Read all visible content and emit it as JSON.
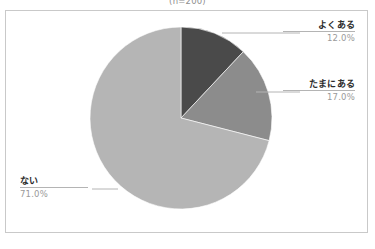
{
  "caption": {
    "sample_size_note": "(n=200)"
  },
  "chart_data": {
    "type": "pie",
    "title": "",
    "subtitle": "(n=200)",
    "xlabel": "",
    "ylabel": "",
    "legend_position": "callout-labels",
    "grid": false,
    "start_angle_deg": 0,
    "direction": "clockwise",
    "categories": [
      "よくある",
      "たまにある",
      "ない"
    ],
    "values": [
      12.0,
      17.0,
      71.0
    ],
    "value_labels": [
      "12.0%",
      "17.0%",
      "71.0%"
    ],
    "unit": "%",
    "colors": [
      "#4a4a4a",
      "#8c8c8c",
      "#b5b5b5"
    ],
    "slices": [
      {
        "label": "よくある",
        "value": 12.0,
        "value_label": "12.0%",
        "color": "#4a4a4a",
        "start_deg": 0.0,
        "end_deg": 43.2
      },
      {
        "label": "たまにある",
        "value": 17.0,
        "value_label": "17.0%",
        "color": "#8c8c8c",
        "start_deg": 43.2,
        "end_deg": 104.4
      },
      {
        "label": "ない",
        "value": 71.0,
        "value_label": "71.0%",
        "color": "#b5b5b5",
        "start_deg": 104.4,
        "end_deg": 360.0
      }
    ]
  },
  "callouts": [
    {
      "label": "よくある",
      "value_label": "12.0%"
    },
    {
      "label": "たまにある",
      "value_label": "17.0%"
    },
    {
      "label": "ない",
      "value_label": "71.0%"
    }
  ],
  "frame": {
    "border_color": "#c9c9c9",
    "background_color": "#ffffff"
  }
}
